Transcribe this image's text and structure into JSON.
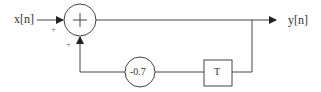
{
  "diagram": {
    "input_label": "x[n]",
    "output_label": "y[n]",
    "adder_symbol": "+",
    "input_sign": "+",
    "feedback_sign": "+",
    "gain_value": "-0.7",
    "delay_label": "T",
    "colors": {
      "line": "#333333",
      "background": "#ffffff"
    }
  }
}
